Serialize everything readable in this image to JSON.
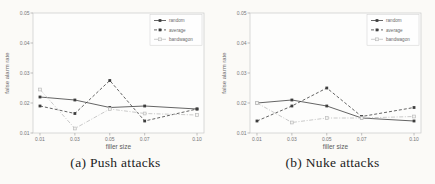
{
  "figure": {
    "background": "#fbfaf7",
    "plot_background": "#fdfdfc",
    "axis_color": "#c9c9c9",
    "tick_color": "#999999",
    "text_color": "#777777"
  },
  "chart_data": [
    {
      "id": "push-attacks",
      "type": "line",
      "caption": "(a) Push attacks",
      "xlabel": "filler size",
      "ylabel": "false alarm rate",
      "x": [
        0.01,
        0.03,
        0.05,
        0.07,
        0.1
      ],
      "xticks": [
        "0.01",
        "0.03",
        "0.05",
        "0.07",
        "0.10"
      ],
      "yticks": [
        "0.01",
        "0.02",
        "0.03",
        "0.04",
        "0.05"
      ],
      "xlim": [
        0.006,
        0.104
      ],
      "ylim": [
        0.01,
        0.05
      ],
      "grid": false,
      "legend_position": "top-right",
      "series": [
        {
          "name": "random",
          "style": "solid",
          "marker": "filled-square",
          "color": "#3d3d3d",
          "values": [
            0.022,
            0.021,
            0.0185,
            0.019,
            0.018
          ]
        },
        {
          "name": "average",
          "style": "dashed",
          "marker": "filled-square",
          "color": "#3d3d3d",
          "values": [
            0.019,
            0.0165,
            0.0275,
            0.014,
            0.018
          ]
        },
        {
          "name": "bandwagon",
          "style": "dashdot",
          "marker": "open-square",
          "color": "#bcbcbc",
          "values": [
            0.0245,
            0.0115,
            0.018,
            0.0165,
            0.016
          ]
        }
      ]
    },
    {
      "id": "nuke-attacks",
      "type": "line",
      "caption": "(b) Nuke attacks",
      "xlabel": "filler size",
      "ylabel": "false alarm rate",
      "x": [
        0.01,
        0.03,
        0.05,
        0.07,
        0.1
      ],
      "xticks": [
        "0.01",
        "0.03",
        "0.05",
        "0.07",
        "0.10"
      ],
      "yticks": [
        "0.01",
        "0.02",
        "0.03",
        "0.04",
        "0.05"
      ],
      "xlim": [
        0.006,
        0.104
      ],
      "ylim": [
        0.01,
        0.05
      ],
      "grid": false,
      "legend_position": "top-right",
      "series": [
        {
          "name": "random",
          "style": "solid",
          "marker": "filled-square",
          "color": "#3d3d3d",
          "values": [
            0.02,
            0.021,
            0.019,
            0.015,
            0.014
          ]
        },
        {
          "name": "average",
          "style": "dashed",
          "marker": "filled-square",
          "color": "#3d3d3d",
          "values": [
            0.014,
            0.019,
            0.025,
            0.0155,
            0.0185
          ]
        },
        {
          "name": "bandwagon",
          "style": "dashdot",
          "marker": "open-square",
          "color": "#bcbcbc",
          "values": [
            0.02,
            0.0135,
            0.015,
            0.015,
            0.0155
          ]
        }
      ]
    }
  ]
}
